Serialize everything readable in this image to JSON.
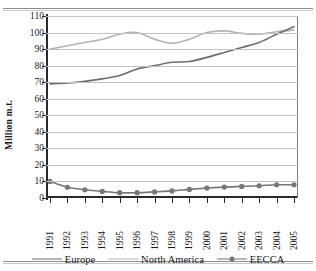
{
  "chart_data": {
    "type": "line",
    "title": "",
    "xlabel": "",
    "ylabel": "Million m.t.",
    "ylim": [
      0,
      110
    ],
    "ytick_values": [
      110,
      100,
      90,
      80,
      70,
      60,
      50,
      40,
      30,
      20,
      10,
      0
    ],
    "ytick_labels": [
      "110",
      "100",
      "90",
      "80",
      "70",
      "60",
      "50",
      "40",
      "30",
      "20",
      "10",
      "0"
    ],
    "grid": true,
    "legend_position": "bottom",
    "categories": [
      "1991",
      "1992",
      "1993",
      "1994",
      "1995",
      "1996",
      "1997",
      "1998",
      "1999",
      "2000",
      "2001",
      "2002",
      "2003",
      "2004",
      "2005"
    ],
    "series": [
      {
        "name": "Europe",
        "color": "#6e6e6e",
        "marker": "none",
        "values": [
          69,
          69.5,
          70.5,
          72,
          74,
          78,
          80,
          82,
          82.5,
          85,
          88,
          91,
          94,
          99,
          103.5
        ]
      },
      {
        "name": "North America",
        "color": "#b4b4b4",
        "marker": "none",
        "values": [
          90,
          92,
          94,
          96,
          99,
          100,
          96,
          93.5,
          96,
          100,
          101,
          99.5,
          99,
          100.5,
          101.5
        ]
      },
      {
        "name": "EECCA",
        "color": "#777777",
        "marker": "circle",
        "values": [
          10,
          6.5,
          5,
          4,
          3.2,
          3.2,
          3.7,
          4.3,
          5.2,
          6,
          6.6,
          7,
          7.4,
          8,
          8
        ]
      }
    ]
  },
  "legend": {
    "items": [
      {
        "label": "Europe"
      },
      {
        "label": "North America"
      },
      {
        "label": "EECCA"
      }
    ]
  }
}
